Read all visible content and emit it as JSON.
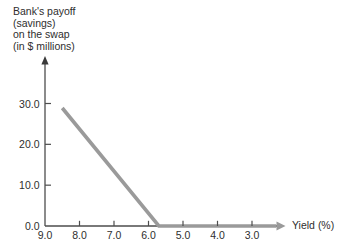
{
  "chart_data": {
    "type": "line",
    "y_axis_title_lines": [
      "Bank's payoff",
      "(savings)",
      "on the swap",
      "(in $ millions)"
    ],
    "xlabel": "Yield (%)",
    "x_tick_labels": [
      "9.0",
      "8.0",
      "7.0",
      "6.0",
      "5.0",
      "4.0",
      "3.0"
    ],
    "y_tick_labels": [
      "0.0",
      "10.0",
      "20.0",
      "30.0"
    ],
    "x_axis_reversed": true,
    "x_range_displayed": [
      9.0,
      3.0
    ],
    "ylim": [
      0,
      35
    ],
    "grid": false,
    "legend": "none",
    "axis_color": "#4d4d4d",
    "text_color": "#2e2e2e",
    "series": [
      {
        "name": "bank-payoff-line",
        "color": "#9a9a9a",
        "points_x_yield_pct": [
          8.5,
          5.7,
          2.3
        ],
        "points_y_payoff_millions": [
          28.9,
          0,
          0
        ],
        "description": "Payoff declines linearly from about $29M at 8.5% yield to $0 at about 5.7% yield, then stays at 0 along the axis to the right arrow"
      }
    ]
  }
}
